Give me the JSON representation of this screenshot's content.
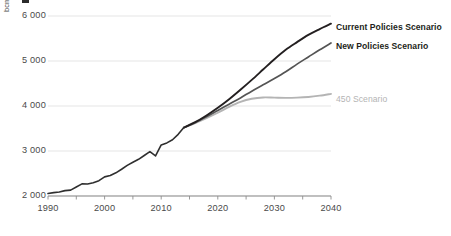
{
  "chart_data": {
    "type": "line",
    "title": "",
    "subtitle": "",
    "xlabel": "",
    "ylabel": "bcm",
    "unit": "bcm",
    "xlim": [
      1990,
      2040
    ],
    "ylim": [
      2000,
      6000
    ],
    "grid": true,
    "legend_position": "inline-right",
    "xticks": [
      "1990",
      "2000",
      "2010",
      "2020",
      "2030",
      "2040"
    ],
    "xtick_values": [
      1990,
      2000,
      2010,
      2020,
      2030,
      2040
    ],
    "minor_xtick_values": [
      1995,
      2005,
      2015,
      2025,
      2035
    ],
    "yticks": [
      "2 000",
      "3 000",
      "4 000",
      "5 000",
      "6 000"
    ],
    "ytick_values": [
      2000,
      3000,
      4000,
      5000,
      6000
    ],
    "series": [
      {
        "name": "Current Policies Scenario",
        "color": "#231f20",
        "width": 1.9,
        "label_x": 336,
        "label_y": 22,
        "bold": true,
        "x": [
          2014,
          2016,
          2018,
          2020,
          2022,
          2024,
          2026,
          2028,
          2030,
          2032,
          2034,
          2036,
          2038,
          2040
        ],
        "values": [
          3520,
          3640,
          3790,
          3960,
          4150,
          4360,
          4580,
          4810,
          5040,
          5250,
          5420,
          5580,
          5710,
          5830
        ]
      },
      {
        "name": "New Policies Scenario",
        "color": "#545454",
        "width": 1.7,
        "label_x": 336,
        "label_y": 41,
        "bold": true,
        "x": [
          2014,
          2016,
          2018,
          2020,
          2022,
          2024,
          2026,
          2028,
          2030,
          2032,
          2034,
          2036,
          2038,
          2040
        ],
        "values": [
          3520,
          3630,
          3760,
          3900,
          4040,
          4180,
          4330,
          4470,
          4610,
          4760,
          4930,
          5090,
          5250,
          5400
        ]
      },
      {
        "name": "450 Scenario",
        "color": "#b4b4b4",
        "width": 1.9,
        "label_x": 336,
        "label_y": 94,
        "bold": false,
        "x": [
          2014,
          2016,
          2018,
          2020,
          2022,
          2024,
          2026,
          2028,
          2030,
          2032,
          2034,
          2036,
          2038,
          2040
        ],
        "values": [
          3520,
          3620,
          3730,
          3850,
          3980,
          4090,
          4160,
          4190,
          4185,
          4180,
          4185,
          4200,
          4230,
          4270
        ]
      },
      {
        "name": "Historical",
        "color": "#2f2f2f",
        "width": 1.6,
        "historical": true,
        "x": [
          1990,
          1991,
          1992,
          1993,
          1994,
          1995,
          1996,
          1997,
          1998,
          1999,
          2000,
          2001,
          2002,
          2003,
          2004,
          2005,
          2006,
          2007,
          2008,
          2009,
          2010,
          2011,
          2012,
          2013,
          2014
        ],
        "values": [
          2055,
          2075,
          2090,
          2120,
          2130,
          2200,
          2270,
          2265,
          2295,
          2340,
          2425,
          2455,
          2515,
          2595,
          2680,
          2750,
          2815,
          2900,
          2985,
          2890,
          3135,
          3180,
          3250,
          3370,
          3520
        ]
      }
    ]
  }
}
